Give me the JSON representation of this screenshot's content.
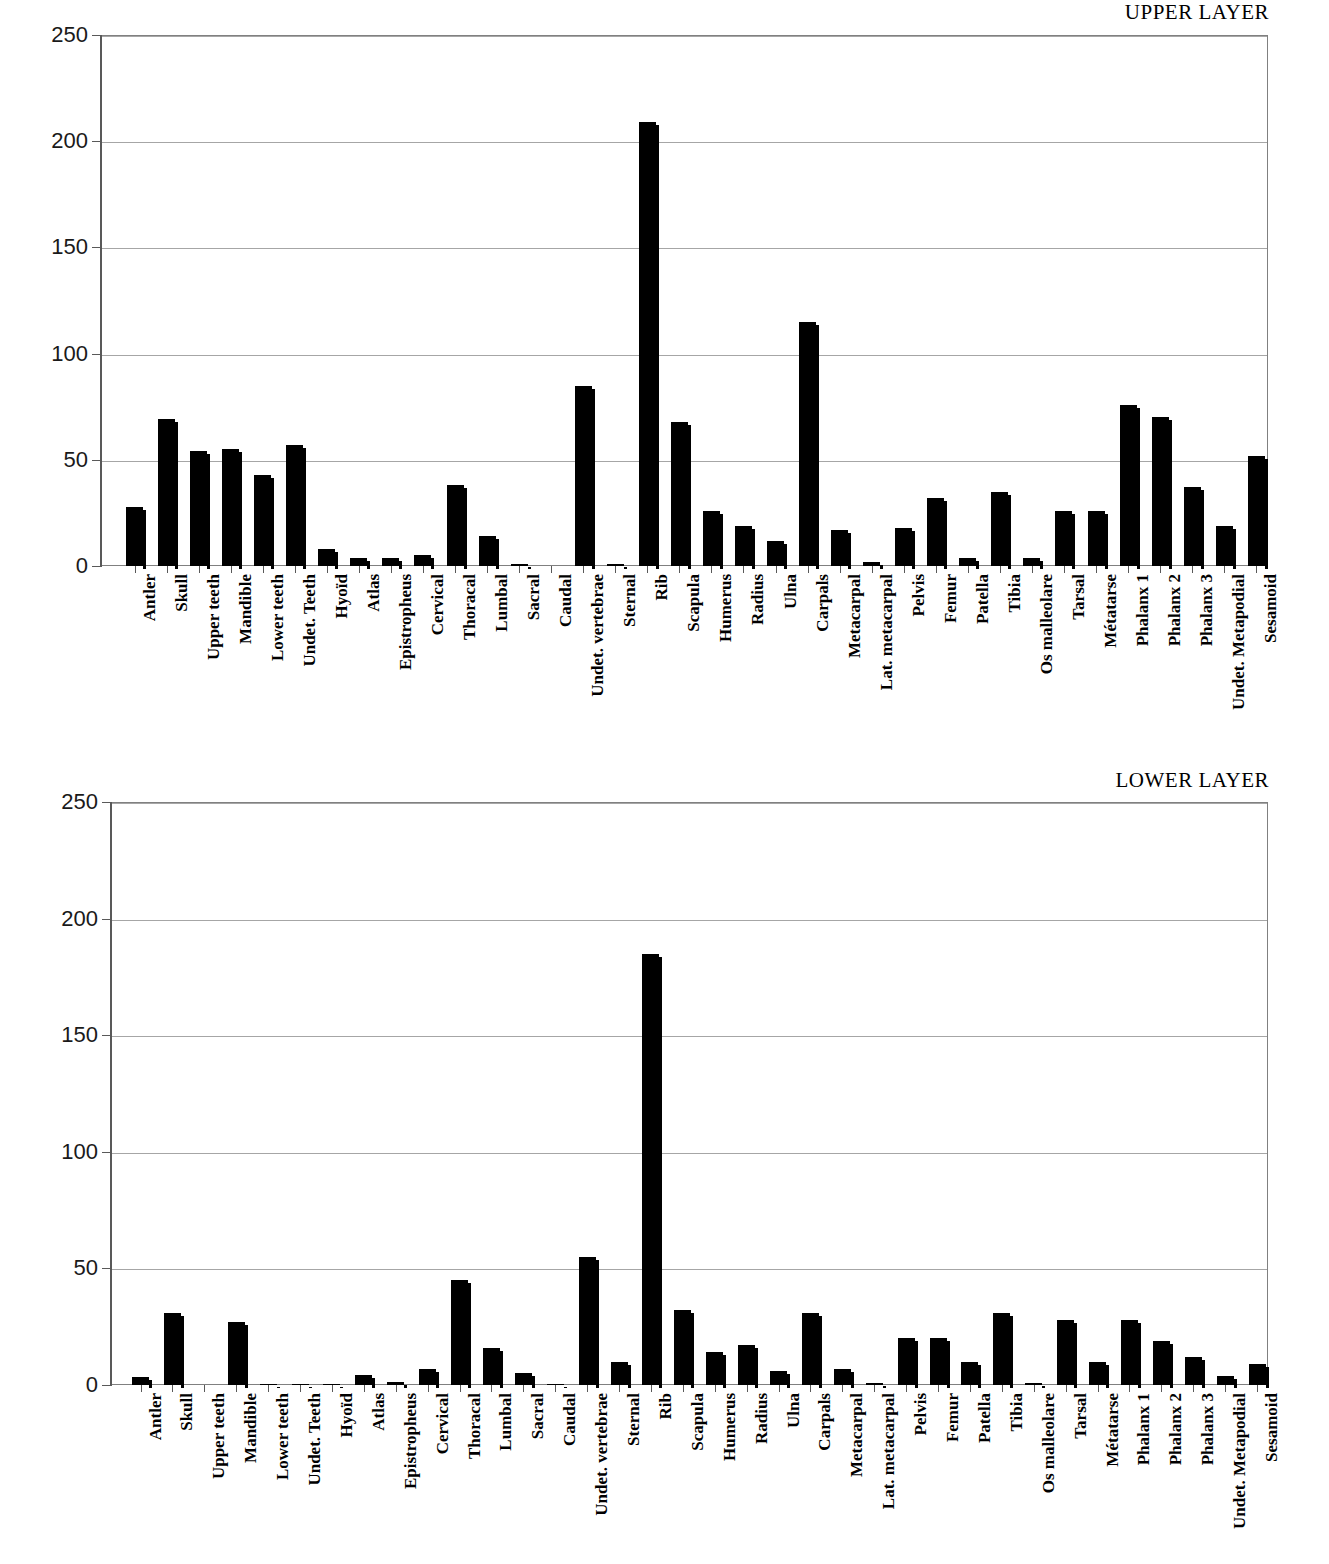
{
  "charts": [
    {
      "id": "upper",
      "title": "UPPER LAYER"
    },
    {
      "id": "lower",
      "title": "LOWER LAYER"
    }
  ],
  "axis": {
    "y_ticks": [
      "0",
      "50",
      "100",
      "150",
      "200",
      "250"
    ],
    "y_min": 0,
    "y_max": 250
  },
  "chart_data": [
    {
      "type": "bar",
      "title": "UPPER LAYER",
      "xlabel": "",
      "ylabel": "",
      "ylim": [
        0,
        250
      ],
      "yticks": [
        0,
        50,
        100,
        150,
        200,
        250
      ],
      "grid": "horizontal",
      "legend": "none",
      "bar_color": "#000000",
      "categories": [
        "Antler",
        "Skull",
        "Upper teeth",
        "Mandible",
        "Lower teeth",
        "Undet. Teeth",
        "Hyoïd",
        "Atlas",
        "Epistropheus",
        "Cervical",
        "Thoracal",
        "Lumbal",
        "Sacral",
        "Caudal",
        "Undet. vertebrae",
        "Sternal",
        "Rib",
        "Scapula",
        "Humerus",
        "Radius",
        "Ulna",
        "Carpals",
        "Metacarpal",
        "Lat. metacarpal",
        "Pelvis",
        "Femur",
        "Patella",
        "Tibia",
        "Os malleolare",
        "Tarsal",
        "Métatarse",
        "Phalanx 1",
        "Phalanx 2",
        "Phalanx 3",
        "Undet. Metapodial",
        "Sesamoid"
      ],
      "values": [
        28,
        69,
        54,
        55,
        43,
        57,
        8,
        4,
        4,
        5,
        38,
        14,
        1,
        0,
        85,
        1,
        209,
        68,
        26,
        19,
        12,
        115,
        17,
        2,
        18,
        32,
        4,
        35,
        4,
        26,
        26,
        76,
        70,
        37,
        19,
        52
      ]
    },
    {
      "type": "bar",
      "title": "LOWER LAYER",
      "xlabel": "",
      "ylabel": "",
      "ylim": [
        0,
        250
      ],
      "yticks": [
        0,
        50,
        100,
        150,
        200,
        250
      ],
      "grid": "horizontal",
      "legend": "none",
      "bar_color": "#000000",
      "categories": [
        "Antler",
        "Skull",
        "Upper teeth",
        "Mandible",
        "Lower teeth",
        "Undet. Teeth",
        "Hyoïd",
        "Atlas",
        "Epistropheus",
        "Cervical",
        "Thoracal",
        "Lumbal",
        "Sacral",
        "Caudal",
        "Undet. vertebrae",
        "Sternal",
        "Rib",
        "Scapula",
        "Humerus",
        "Radius",
        "Ulna",
        "Carpals",
        "Metacarpal",
        "Lat. metacarpal",
        "Pelvis",
        "Femur",
        "Patella",
        "Tibia",
        "Os malleolare",
        "Tarsal",
        "Métatarse",
        "Phalanx 1",
        "Phalanx 2",
        "Phalanx 3",
        "Undet. Metapodial",
        "Sesamoid"
      ],
      "values": [
        3.5,
        31,
        0,
        27,
        0.6,
        0.6,
        0.5,
        4.5,
        1.5,
        7,
        45,
        16,
        5,
        0.5,
        55,
        10,
        185,
        32,
        14,
        17,
        6,
        31,
        7,
        1,
        20,
        20,
        10,
        31,
        1,
        28,
        10,
        28,
        19,
        12,
        4,
        9
      ]
    }
  ]
}
